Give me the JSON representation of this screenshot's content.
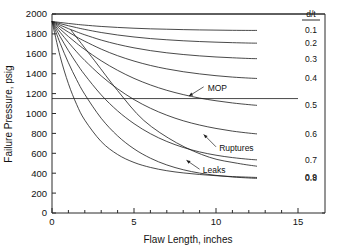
{
  "chart_data": {
    "type": "line",
    "title": "",
    "xlabel": "Flaw Length, inches",
    "ylabel": "Failure Pressure, psig",
    "xlim": [
      0,
      15
    ],
    "ylim": [
      0,
      2000
    ],
    "xticks": [
      0,
      5,
      10,
      15
    ],
    "xtick_labels": [
      "0",
      "5",
      "10",
      "15"
    ],
    "xminor_step": 1,
    "yticks": [
      0,
      200,
      400,
      600,
      800,
      1000,
      1200,
      1400,
      1600,
      1800,
      2000
    ],
    "ytick_labels": [
      "0",
      "200",
      "400",
      "600",
      "800",
      "1000",
      "1200",
      "1400",
      "1600",
      "1800",
      "2000"
    ],
    "grid": false,
    "legend_position": "right",
    "legend_title": "d/t",
    "origin_pressure": 1925,
    "series": [
      {
        "name": "0.1",
        "label": "0.1",
        "x": [
          0,
          0.5,
          1,
          1.5,
          2,
          3,
          4,
          5,
          6,
          7,
          8,
          9,
          10,
          11,
          12,
          12.5
        ],
        "y": [
          1925,
          1915,
          1905,
          1896,
          1888,
          1875,
          1865,
          1857,
          1851,
          1847,
          1843,
          1840,
          1838,
          1836,
          1835,
          1835
        ]
      },
      {
        "name": "0.2",
        "label": "0.2",
        "x": [
          0,
          0.5,
          1,
          1.5,
          2,
          3,
          4,
          5,
          6,
          7,
          8,
          9,
          10,
          11,
          12,
          12.5
        ],
        "y": [
          1925,
          1903,
          1882,
          1863,
          1845,
          1814,
          1789,
          1769,
          1753,
          1741,
          1731,
          1723,
          1717,
          1712,
          1708,
          1707
        ]
      },
      {
        "name": "0.3",
        "label": "0.3",
        "x": [
          0,
          0.5,
          1,
          1.5,
          2,
          3,
          4,
          5,
          6,
          7,
          8,
          9,
          10,
          11,
          12,
          12.5
        ],
        "y": [
          1925,
          1888,
          1853,
          1821,
          1791,
          1738,
          1695,
          1660,
          1632,
          1610,
          1593,
          1579,
          1568,
          1560,
          1553,
          1551
        ]
      },
      {
        "name": "0.4",
        "label": "0.4",
        "x": [
          0,
          0.5,
          1,
          1.5,
          2,
          3,
          4,
          5,
          6,
          7,
          8,
          9,
          10,
          11,
          12,
          12.5
        ],
        "y": [
          1925,
          1870,
          1818,
          1770,
          1726,
          1647,
          1581,
          1527,
          1483,
          1448,
          1420,
          1398,
          1380,
          1366,
          1356,
          1352
        ]
      },
      {
        "name": "0.5",
        "label": "0.5",
        "x": [
          0,
          0.5,
          1,
          1.5,
          2,
          3,
          4,
          5,
          6,
          7,
          8,
          9,
          10,
          11,
          12,
          12.5
        ],
        "y": [
          1925,
          1847,
          1774,
          1706,
          1643,
          1530,
          1434,
          1353,
          1287,
          1233,
          1190,
          1155,
          1128,
          1106,
          1089,
          1082
        ]
      },
      {
        "name": "0.6",
        "label": "0.6",
        "x": [
          0,
          0.5,
          1,
          1.5,
          2,
          3,
          4,
          5,
          6,
          7,
          8,
          9,
          10,
          11,
          12,
          12.5
        ],
        "y": [
          1925,
          1816,
          1715,
          1620,
          1533,
          1378,
          1248,
          1140,
          1053,
          983,
          927,
          884,
          850,
          823,
          803,
          795
        ]
      },
      {
        "name": "0.7",
        "label": "0.7",
        "x": [
          0,
          0.5,
          1,
          1.5,
          2,
          3,
          4,
          5,
          6,
          7,
          8,
          9,
          10,
          11,
          12,
          12.5
        ],
        "y": [
          1925,
          1772,
          1632,
          1504,
          1388,
          1187,
          1026,
          898,
          797,
          719,
          659,
          614,
          581,
          557,
          540,
          534
        ]
      },
      {
        "name": "0.8",
        "label": "0.8",
        "x": [
          0,
          0.5,
          1,
          1.5,
          2,
          3,
          4,
          5,
          6,
          7,
          8,
          9,
          10,
          11,
          12,
          12.5
        ],
        "y": [
          1925,
          1705,
          1510,
          1340,
          1192,
          952,
          775,
          645,
          551,
          483,
          435,
          401,
          378,
          362,
          352,
          348
        ]
      },
      {
        "name": "0.9",
        "label": "0.9",
        "x": [
          0,
          0.5,
          1,
          1.5,
          2,
          3,
          4,
          5,
          6,
          7,
          8,
          9,
          10,
          11,
          12,
          12.5
        ],
        "y": [
          1925,
          1572,
          1300,
          1092,
          933,
          718,
          588,
          508,
          458,
          425,
          403,
          387,
          375,
          366,
          360,
          357
        ]
      }
    ],
    "reference_lines": [
      {
        "name": "MOP",
        "type": "horizontal",
        "value": 1150,
        "label": "MOP"
      }
    ],
    "annotations": [
      {
        "label": "MOP",
        "x": 9.4,
        "y": 1258
      },
      {
        "label": "Ruptures",
        "x": 10.1,
        "y": 655
      },
      {
        "label": "Leaks",
        "x": 9.1,
        "y": 430
      }
    ],
    "divider": {
      "name": "leak-rupture-divider",
      "x": [
        1.15,
        2.6,
        4.0,
        5.6,
        7.6,
        9.6,
        11.3,
        12.5
      ],
      "y": [
        1840,
        1530,
        1230,
        930,
        705,
        560,
        500,
        470
      ]
    }
  }
}
